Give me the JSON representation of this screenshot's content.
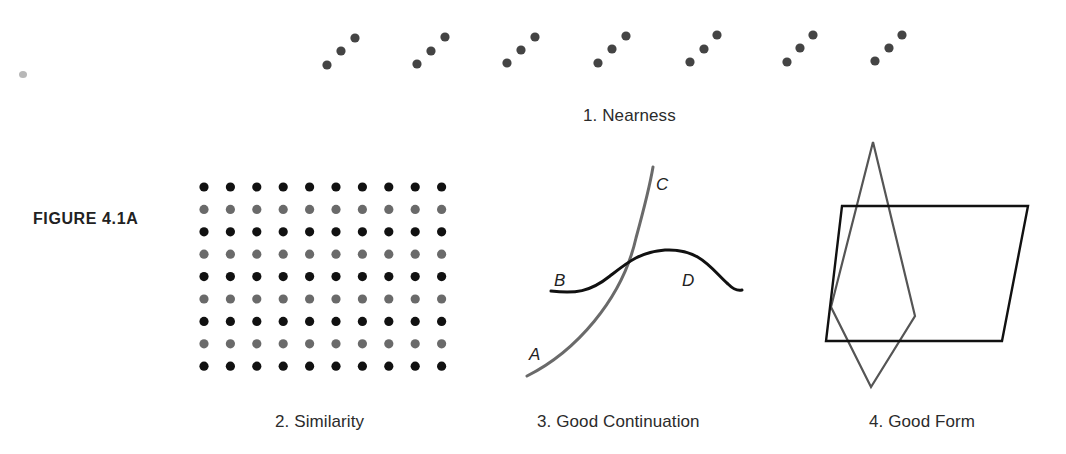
{
  "figure": {
    "label": "FIGURE 4.1A"
  },
  "panels": {
    "nearness": {
      "caption": "1. Nearness",
      "dot_color": "#444444",
      "dot_radius": 4.6,
      "triplets": [
        [
          [
            327,
            65
          ],
          [
            341,
            51
          ],
          [
            355,
            38
          ]
        ],
        [
          [
            417,
            64
          ],
          [
            431,
            51
          ],
          [
            445,
            37
          ]
        ],
        [
          [
            507,
            63
          ],
          [
            521,
            50
          ],
          [
            535,
            37
          ]
        ],
        [
          [
            598,
            63
          ],
          [
            612,
            49
          ],
          [
            626,
            36
          ]
        ],
        [
          [
            690,
            62
          ],
          [
            704,
            49
          ],
          [
            717,
            35
          ]
        ],
        [
          [
            787,
            62
          ],
          [
            800,
            48
          ],
          [
            813,
            35
          ]
        ],
        [
          [
            875,
            61
          ],
          [
            889,
            48
          ],
          [
            902,
            35
          ]
        ]
      ]
    },
    "similarity": {
      "caption": "2. Similarity",
      "columns": 10,
      "rows": 9,
      "origin_x": 204,
      "origin_y": 187,
      "spacing_x": 26.4,
      "spacing_y": 22.4,
      "dot_radius": 4.6,
      "row_colors": [
        "#111111",
        "#6a6a6a",
        "#111111",
        "#6a6a6a",
        "#111111",
        "#6a6a6a",
        "#111111",
        "#6a6a6a",
        "#111111"
      ]
    },
    "good_continuation": {
      "caption": "3. Good Continuation",
      "curve_gray": {
        "color": "#6a6a6a",
        "path": "M527,376 C575,352 622,300 636,238 C645,205 650,185 653,167"
      },
      "curve_black": {
        "color": "#111111",
        "path": "M551,291 C575,294 590,292 610,276 C628,262 640,252 665,250 C700,248 712,270 728,284 C733,289 738,291 742,290"
      },
      "labels": {
        "A": "A",
        "B": "B",
        "C": "C",
        "D": "D"
      }
    },
    "good_form": {
      "caption": "4. Good Form",
      "parallelogram": {
        "color": "#111111",
        "points": "842,206 1028,206 1002,341 826,341"
      },
      "kite": {
        "color": "#555555",
        "points": "873,142 915,316 871,387 831,307"
      }
    }
  }
}
